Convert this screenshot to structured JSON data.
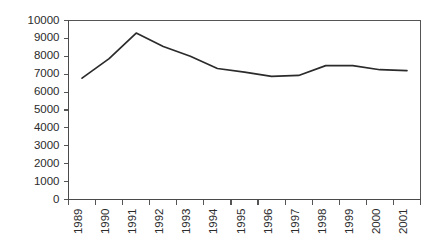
{
  "chart_data": {
    "type": "line",
    "title": "",
    "subtitle": "",
    "xlabel": "",
    "ylabel": "",
    "categories": [
      "1989",
      "1990",
      "1991",
      "1992",
      "1993",
      "1994",
      "1995",
      "1996",
      "1997",
      "1998",
      "1999",
      "2000",
      "2001"
    ],
    "values": [
      6780,
      7870,
      9300,
      8550,
      8000,
      7320,
      7120,
      6880,
      6930,
      7480,
      7480,
      7250,
      7200
    ],
    "series": [
      {
        "name": "series-1",
        "values": [
          6780,
          7870,
          9300,
          8550,
          8000,
          7320,
          7120,
          6880,
          6930,
          7480,
          7480,
          7250,
          7200
        ]
      }
    ],
    "ylim": [
      0,
      10000
    ],
    "ytick_values": [
      0,
      1000,
      2000,
      3000,
      4000,
      5000,
      6000,
      7000,
      8000,
      9000,
      10000
    ],
    "ytick_labels": [
      "0",
      "1000",
      "2000",
      "3000",
      "4000",
      "5000",
      "6000",
      "7000",
      "8000",
      "9000",
      "10000"
    ],
    "xtick_labels": [
      "1989",
      "1990",
      "1991",
      "1992",
      "1993",
      "1994",
      "1995",
      "1996",
      "1997",
      "1998",
      "1999",
      "2000",
      "2001"
    ],
    "xtick_rotation": -90,
    "grid": false,
    "legend": null,
    "legend_position": "none",
    "annotations": [],
    "colors": {
      "line": "#2b2b2b",
      "axis": "#555555",
      "text": "#2b2b2b",
      "background": "#ffffff"
    }
  }
}
